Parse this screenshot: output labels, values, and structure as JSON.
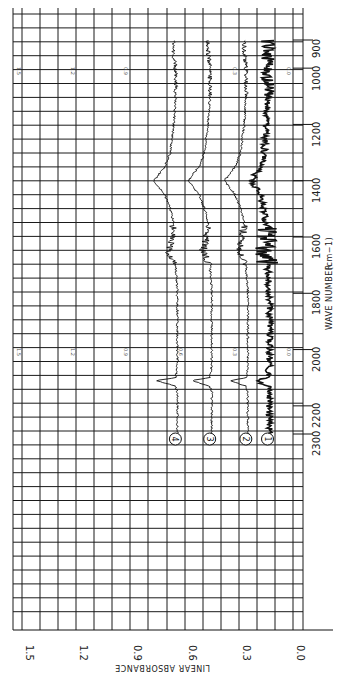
{
  "chart_data": {
    "type": "line",
    "orientation": "rotated 90 degrees clockwise (x-axis vertical on right, y-axis horizontal at bottom, text rotated)",
    "title": "",
    "xlabel": "WAVE NUMBER (cm-1)",
    "ylabel": "LINEAR ABSORBANCE",
    "x_ticks": [
      900,
      1000,
      1200,
      1400,
      1600,
      1800,
      2000,
      2200,
      2300
    ],
    "y_ticks": [
      "0.0",
      "0.3",
      "0.6",
      "0.9",
      "1.2",
      "1.5"
    ],
    "xlim": [
      2300,
      900
    ],
    "ylim": [
      0.0,
      1.5
    ],
    "grid": true,
    "inner_scale_labels": [
      {
        "position": "near 1000 cm-1",
        "labels": [
          "1.5",
          "1.2",
          "0.9",
          "0.3",
          "0.0"
        ]
      },
      {
        "position": "near 2000 cm-1",
        "labels": [
          "1.5",
          "1.2",
          "0.9",
          "0.6",
          "0.3",
          "0.0"
        ]
      }
    ],
    "legend": "circled numeric markers at 2300 cm-1",
    "x": [
      2300,
      2200,
      2150,
      2130,
      2110,
      2100,
      2050,
      2000,
      1900,
      1800,
      1700,
      1650,
      1600,
      1550,
      1500,
      1450,
      1400,
      1350,
      1300,
      1200,
      1100,
      1000,
      950,
      900
    ],
    "series": [
      {
        "name": "1",
        "values": [
          0.13,
          0.13,
          0.13,
          0.14,
          0.2,
          0.14,
          0.13,
          0.13,
          0.13,
          0.13,
          0.14,
          0.16,
          0.15,
          0.15,
          0.16,
          0.18,
          0.23,
          0.18,
          0.16,
          0.15,
          0.14,
          0.14,
          0.14,
          0.14
        ]
      },
      {
        "name": "2",
        "values": [
          0.25,
          0.25,
          0.25,
          0.26,
          0.35,
          0.26,
          0.25,
          0.25,
          0.25,
          0.25,
          0.26,
          0.3,
          0.28,
          0.27,
          0.29,
          0.32,
          0.38,
          0.32,
          0.29,
          0.27,
          0.26,
          0.26,
          0.27,
          0.27
        ]
      },
      {
        "name": "3",
        "values": [
          0.45,
          0.45,
          0.45,
          0.46,
          0.56,
          0.46,
          0.45,
          0.45,
          0.45,
          0.45,
          0.46,
          0.5,
          0.48,
          0.47,
          0.49,
          0.52,
          0.58,
          0.52,
          0.49,
          0.47,
          0.46,
          0.46,
          0.47,
          0.47
        ]
      },
      {
        "name": "4",
        "values": [
          0.64,
          0.64,
          0.64,
          0.65,
          0.76,
          0.65,
          0.64,
          0.64,
          0.64,
          0.64,
          0.65,
          0.69,
          0.67,
          0.66,
          0.68,
          0.71,
          0.77,
          0.71,
          0.68,
          0.66,
          0.65,
          0.65,
          0.66,
          0.66
        ]
      }
    ]
  },
  "axes": {
    "x_title": "WAVE NUMBER",
    "x_unit": "(cm−1)",
    "y_title": "LINEAR ABSORBANCE",
    "x_tick_labels": [
      "900",
      "1000",
      "1200",
      "1400",
      "1600",
      "1800",
      "2000",
      "2200",
      "2300"
    ],
    "y_tick_labels": [
      "1.5",
      "1.2",
      "0.9",
      "0.6",
      "0.3",
      "0.0"
    ]
  },
  "inner_labels": {
    "top": [
      "1.5",
      "1.2",
      "0.9",
      "0.3",
      "0.0"
    ],
    "middle": [
      "1.5",
      "1.2",
      "0.9",
      "0.6",
      "0.3",
      "0.0"
    ]
  },
  "markers": [
    "1",
    "2",
    "3",
    "4"
  ]
}
